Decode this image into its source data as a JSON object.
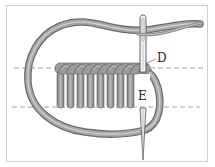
{
  "diagram": {
    "labels": {
      "point_d": "D",
      "point_e": "E"
    },
    "guide_lines": 2,
    "stitch_count": 8,
    "colors": {
      "thread": "#9a9a9a",
      "thread_dark": "#6e6e6e",
      "needle": "#b8b8b8",
      "guide": "#8a8a8a",
      "frame": "#cfcfcf"
    }
  }
}
